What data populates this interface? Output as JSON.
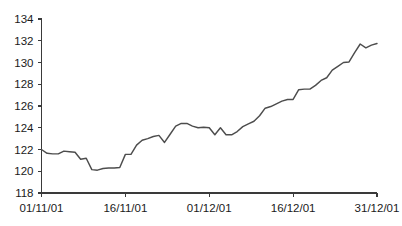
{
  "chart_data": {
    "type": "line",
    "title": "",
    "subtitle": "",
    "xlabel": "",
    "ylabel": "",
    "grid": false,
    "legend": false,
    "legend_position": "none",
    "line_color": "#4d4d4d",
    "axis_color": "#3a3a3a",
    "background": "#ffffff",
    "ylim": [
      118,
      134
    ],
    "yticks": [
      118,
      120,
      122,
      124,
      126,
      128,
      130,
      132,
      134
    ],
    "ytick_labels": [
      "118",
      "120",
      "122",
      "124",
      "126",
      "128",
      "130",
      "132",
      "134"
    ],
    "xlim": [
      0,
      60
    ],
    "xticks": [
      0,
      15,
      30,
      45,
      60
    ],
    "xtick_labels": [
      "01/11/01",
      "16/11/01",
      "01/12/01",
      "16/12/01",
      "31/12/01"
    ],
    "series": [
      {
        "name": "index",
        "x": [
          0,
          1,
          2,
          3,
          4,
          5,
          6,
          7,
          8,
          9,
          10,
          11,
          12,
          13,
          14,
          15,
          16,
          17,
          18,
          19,
          20,
          21,
          22,
          23,
          24,
          25,
          26,
          27,
          28,
          29,
          30,
          31,
          32,
          33,
          34,
          35,
          36,
          37,
          38,
          39,
          40,
          41,
          42,
          43,
          44,
          45,
          46,
          47,
          48,
          49,
          50,
          51,
          52,
          53,
          54,
          55,
          56,
          57,
          58,
          59,
          60
        ],
        "values": [
          122.0,
          121.65,
          121.6,
          121.6,
          121.85,
          121.8,
          121.75,
          121.1,
          121.2,
          120.15,
          120.1,
          120.25,
          120.3,
          120.3,
          120.35,
          121.55,
          121.55,
          122.4,
          122.85,
          123.0,
          123.2,
          123.3,
          122.65,
          123.4,
          124.15,
          124.4,
          124.4,
          124.15,
          124.0,
          124.05,
          124.0,
          123.35,
          124.0,
          123.35,
          123.35,
          123.65,
          124.1,
          124.35,
          124.6,
          125.1,
          125.8,
          125.95,
          126.2,
          126.45,
          126.6,
          126.6,
          127.5,
          127.55,
          127.55,
          127.9,
          128.35,
          128.6,
          129.3,
          129.65,
          130.0,
          130.05,
          130.9,
          131.7,
          131.35,
          131.6,
          131.75
        ]
      }
    ]
  },
  "axes": {
    "y_axis_name": "value-axis",
    "x_axis_name": "date-axis"
  }
}
